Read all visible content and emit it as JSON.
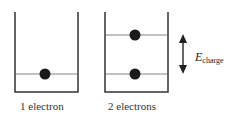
{
  "diagram": {
    "boxes": [
      {
        "id": "box-1",
        "caption": "1 electron",
        "levels": [
          74
        ],
        "electrons": [
          {
            "x": 45,
            "y": 74
          }
        ]
      },
      {
        "id": "box-2",
        "caption": "2 electrons",
        "levels": [
          35,
          74
        ],
        "electrons": [
          {
            "x": 135,
            "y": 35
          },
          {
            "x": 135,
            "y": 74
          }
        ]
      }
    ],
    "arrow": {
      "label_main": "E",
      "label_sub": "charge"
    },
    "colors": {
      "line": "#333333",
      "electron": "#1a1a1a"
    }
  }
}
